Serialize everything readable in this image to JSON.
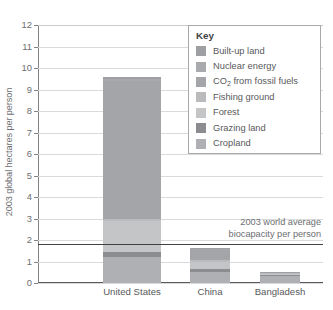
{
  "chart_data": {
    "type": "bar",
    "stacked": true,
    "title": "",
    "xlabel": "",
    "ylabel": "2003 global hectares per person",
    "ylim": [
      0,
      12
    ],
    "ytick_step": 1,
    "yticks": [
      "0",
      "1",
      "2",
      "3",
      "4",
      "5",
      "6",
      "7",
      "8",
      "9",
      "10",
      "11",
      "12"
    ],
    "grid": true,
    "legend_position": "top-right",
    "categories": [
      "United States",
      "China",
      "Bangladesh"
    ],
    "series": [
      {
        "name": "Cropland",
        "values": [
          1.2,
          0.5,
          0.35
        ]
      },
      {
        "name": "Grazing land",
        "values": [
          0.25,
          0.15,
          0.04
        ]
      },
      {
        "name": "Forest",
        "values": [
          1.45,
          0.35,
          0.06
        ]
      },
      {
        "name": "Fishing ground",
        "values": [
          0.1,
          0.05,
          0.02
        ]
      },
      {
        "name": "CO2 from fossil fuels",
        "values": [
          6.4,
          0.5,
          0.02
        ]
      },
      {
        "name": "Nuclear energy",
        "values": [
          0.1,
          0.02,
          0.0
        ]
      },
      {
        "name": "Built-up land",
        "values": [
          0.1,
          0.08,
          0.01
        ]
      }
    ],
    "totals": [
      9.6,
      1.65,
      0.5
    ],
    "annotations": [
      {
        "name": "world-average-biocapacity",
        "value": 1.8,
        "line1": "2003 world average",
        "line2": "biocapacity per person"
      }
    ]
  },
  "legend": {
    "title": "Key",
    "items": [
      {
        "label": "Built-up land",
        "color": "#9d9fa2"
      },
      {
        "label": "Nuclear energy",
        "color": "#a8aaad"
      },
      {
        "label": "CO2 from fossil fuels",
        "color": "#a3a5a8",
        "label_pre": "CO",
        "label_sub": "2",
        "label_post": " from fossil fuels"
      },
      {
        "label": "Fishing ground",
        "color": "#b9bbbd"
      },
      {
        "label": "Forest",
        "color": "#c3c5c7"
      },
      {
        "label": "Grazing land",
        "color": "#8b8d90"
      },
      {
        "label": "Cropland",
        "color": "#aeb0b3"
      }
    ]
  },
  "axis": {
    "y_title": "2003 global hectares per person"
  },
  "categories": [
    {
      "label": "United States"
    },
    {
      "label": "China"
    },
    {
      "label": "Bangladesh"
    }
  ],
  "colors": {
    "built_up_land": "#9d9fa2",
    "nuclear_energy": "#a8aaad",
    "co2_fossil_fuels": "#a3a5a8",
    "fishing_ground": "#b9bbbd",
    "forest": "#c3c5c7",
    "grazing_land": "#8b8d90",
    "cropland": "#aeb0b3",
    "gridline": "#d9dadb",
    "axis": "#808285",
    "benchmark": "#414042",
    "text": "#58595b"
  }
}
